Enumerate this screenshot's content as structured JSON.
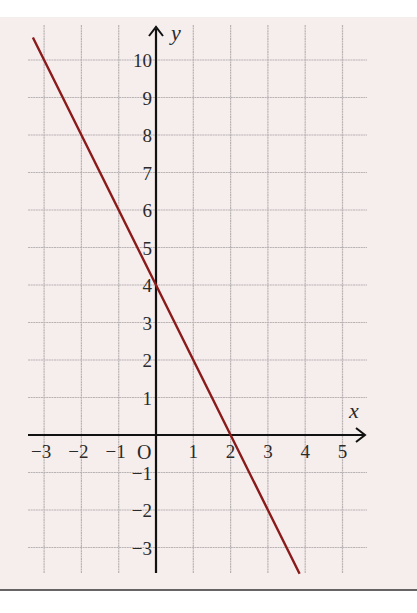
{
  "chart_data": {
    "type": "line",
    "title": "",
    "xlabel": "x",
    "ylabel": "y",
    "origin_label": "O",
    "xlim": [
      -3.3,
      5.6
    ],
    "ylim": [
      -3.7,
      10.6
    ],
    "grid": true,
    "x_ticks": [
      -3,
      -2,
      -1,
      1,
      2,
      3,
      4,
      5
    ],
    "x_tick_labels": [
      "−3",
      "−2",
      "−1",
      "1",
      "2",
      "3",
      "4",
      "5"
    ],
    "y_ticks": [
      10,
      9,
      8,
      7,
      6,
      5,
      4,
      3,
      2,
      1,
      -1,
      -2,
      -3
    ],
    "y_tick_labels": [
      "10",
      "9",
      "8",
      "7",
      "6",
      "5",
      "4",
      "3",
      "2",
      "1",
      "−1",
      "−2",
      "−3"
    ],
    "series": [
      {
        "name": "y = -2x + 4",
        "equation": "y = -2x + 4",
        "color": "#8b1a1a",
        "x": [
          -3.3,
          -3,
          -2,
          -1,
          0,
          1,
          2,
          3,
          3.85
        ],
        "y": [
          10.6,
          10,
          8,
          6,
          4,
          2,
          0,
          -2,
          -3.7
        ]
      }
    ],
    "colors": {
      "background": "#f6eded",
      "grid": "#b9b3b3",
      "axes": "#111111",
      "line": "#8b1a1a",
      "frame_bottom": "#333333"
    }
  }
}
